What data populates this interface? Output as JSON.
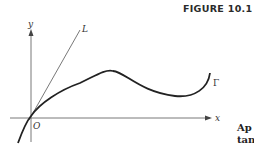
{
  "figure": {
    "label": "FIGURE 10.1",
    "axis_labels": {
      "x": "x",
      "y": "y",
      "origin": "O"
    },
    "curve_labels": {
      "tangent_line": "L",
      "curve": "Γ"
    },
    "side_text": [
      "Ap",
      "tan"
    ]
  }
}
